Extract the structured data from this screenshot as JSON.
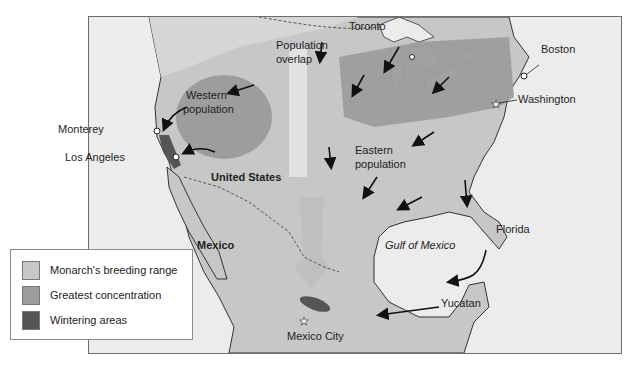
{
  "map": {
    "colors": {
      "ocean": "#ececec",
      "land_outside": "#e2e2e2",
      "breeding_range": "#c7c7c7",
      "greatest_concentration": "#9d9d9d",
      "wintering_areas": "#555555",
      "overlap_band": "#e4e4e4",
      "arrows": "#111111"
    },
    "labels": {
      "toronto": "Toronto",
      "boston": "Boston",
      "washington": "Washington",
      "population_overlap_1": "Population",
      "population_overlap_2": "overlap",
      "western_population_1": "Western",
      "western_population_2": "population",
      "monterey": "Monterey",
      "los_angeles": "Los Angeles",
      "united_states": "United States",
      "eastern_population_1": "Eastern",
      "eastern_population_2": "population",
      "mexico": "Mexico",
      "gulf_of_mexico": "Gulf of Mexico",
      "florida": "Florida",
      "yucatan": "Yucatan",
      "mexico_city": "Mexico City"
    }
  },
  "legend": {
    "items": [
      {
        "label": "Monarch's breeding range",
        "color": "#c7c7c7"
      },
      {
        "label": "Greatest concentration",
        "color": "#9d9d9d"
      },
      {
        "label": "Wintering areas",
        "color": "#555555"
      }
    ]
  }
}
